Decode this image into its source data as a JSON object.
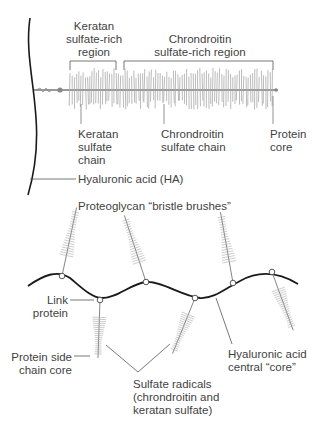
{
  "top_panel": {
    "region_labels": {
      "keratan_region": [
        "Keratan",
        "sulfate-rich",
        "region"
      ],
      "chondroitin_region": [
        "Chrondroitin",
        "sulfate-rich region"
      ]
    },
    "part_labels": {
      "keratan_chain": [
        "Keratan",
        "sulfate",
        "chain"
      ],
      "chondroitin_chain": [
        "Chrondroitin",
        "sulfate chain"
      ],
      "protein_core": [
        "Protein",
        "core"
      ]
    },
    "hyaluronic_acid": "Hyaluronic acid (HA)"
  },
  "bottom_panel": {
    "title": "Proteoglycan “bristle brushes”",
    "link_protein": [
      "Link",
      "protein"
    ],
    "protein_side_chain_core": [
      "Protein side",
      "chain core"
    ],
    "hyaluronic_central_core": [
      "Hyaluronic acid",
      "central “core”"
    ],
    "sulfate_radicals": [
      "Sulfate radicals",
      "(chrondroitin and",
      "keratan sulfate)"
    ]
  },
  "colors": {
    "backbone": "#1a1a1a",
    "bristle": "#9a9a9a",
    "leader_line": "#555555"
  }
}
